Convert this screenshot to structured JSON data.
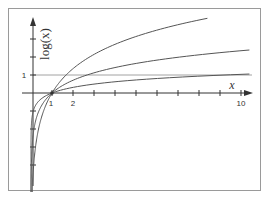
{
  "chart_data": {
    "type": "line",
    "title": "",
    "xlabel": "x",
    "ylabel": "log(x)",
    "xlim": [
      0,
      10.5
    ],
    "ylim": [
      -5.5,
      4.0
    ],
    "x_tick_labels": [
      "1",
      "2",
      "10"
    ],
    "x_ticks": [
      1,
      2,
      3,
      4,
      5,
      6,
      7,
      8,
      9,
      10
    ],
    "y_tick_labels": [
      "1"
    ],
    "y_ticks": [
      -4,
      -3,
      -2,
      -1,
      1,
      2,
      3
    ],
    "reference_line": {
      "y": 1,
      "label": "1"
    },
    "grid": false,
    "legend": null,
    "series": [
      {
        "name": "log curve (small base, steepest)",
        "scale": 1.95,
        "x_max": 8.4,
        "x": [
          0.06,
          0.1,
          0.2,
          0.5,
          1,
          2,
          3,
          4,
          5,
          6,
          7,
          8,
          8.4
        ],
        "values": [
          -5.49,
          -4.49,
          -3.14,
          -1.35,
          0,
          1.35,
          2.14,
          2.7,
          3.14,
          3.49,
          3.79,
          4.05,
          4.15
        ]
      },
      {
        "name": "log curve (medium base)",
        "scale": 1.02,
        "x_max": 10.4,
        "x": [
          0.005,
          0.01,
          0.05,
          0.2,
          0.5,
          1,
          2,
          3,
          5,
          7,
          10,
          10.4
        ],
        "values": [
          -5.4,
          -4.7,
          -3.06,
          -1.64,
          -0.71,
          0,
          0.71,
          1.12,
          1.64,
          1.98,
          2.35,
          2.39
        ]
      },
      {
        "name": "log curve (large base, flattest)",
        "scale": 0.45,
        "x_max": 10.4,
        "x": [
          0.0001,
          0.001,
          0.01,
          0.1,
          0.5,
          1,
          2,
          5,
          10,
          10.4
        ],
        "values": [
          -4.14,
          -3.11,
          -2.07,
          -1.04,
          -0.31,
          0,
          0.31,
          0.72,
          1.04,
          1.05
        ]
      }
    ]
  },
  "axes": {
    "y_label": "log(x)",
    "x_label": "x",
    "x_tick_1": "1",
    "x_tick_2": "2",
    "x_tick_10": "10",
    "y_tick_1": "1"
  },
  "colors": {
    "curve": "#555555",
    "axis": "#333333",
    "reference_line": "#8a8a8a",
    "frame": "#9a9a9a"
  }
}
